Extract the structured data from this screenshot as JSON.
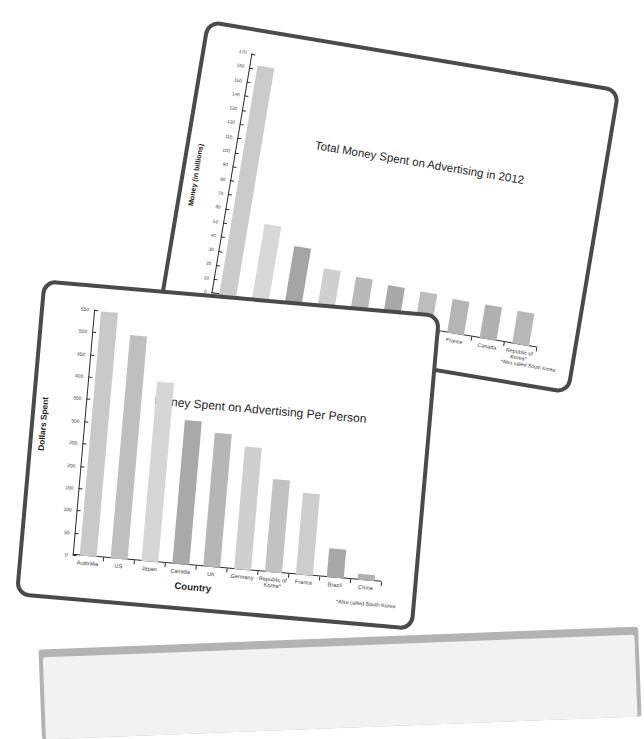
{
  "page": {
    "background_color": "#ffffff",
    "card_border_color": "#4a4a4a",
    "card_background_color": "#ffffff",
    "slab_color": "#b3b3b3"
  },
  "chart_data": [
    {
      "type": "bar",
      "title": "Total Money  Spent on Advertising in 2012",
      "xlabel": "Country",
      "ylabel": "Money (in billions)",
      "footnote": "*Also called South Korea",
      "categories": [
        "US",
        "Japan",
        "China",
        "Germany",
        "UK",
        "Brazil",
        "Australia",
        "France",
        "Canada",
        "Republic of Korea*"
      ],
      "values": [
        162,
        54,
        42,
        30,
        28,
        26,
        25,
        24,
        24,
        23
      ],
      "ylim": [
        0,
        170
      ],
      "yticks": [
        0,
        10,
        20,
        30,
        40,
        50,
        60,
        70,
        80,
        90,
        100,
        110,
        120,
        130,
        140,
        150,
        160,
        170
      ],
      "grid": false,
      "legend": "none",
      "bar_colors": [
        "#cbcbcb",
        "#d8d8d8",
        "#a5a5a5",
        "#cfcfcf",
        "#b9b9b9",
        "#a8a8a8",
        "#bdbdbd",
        "#b5b5b5",
        "#b0b0b0",
        "#b8b8b8"
      ]
    },
    {
      "type": "bar",
      "title": "Money Spent on Advertising Per Person",
      "xlabel": "Country",
      "ylabel": "Dollars Spent",
      "footnote": "*Also called South Korea",
      "categories": [
        "Australia",
        "US",
        "Japan",
        "Canada",
        "UK",
        "Germany",
        "Republic of Korea*",
        "France",
        "Brazil",
        "China"
      ],
      "values": [
        548,
        500,
        403,
        323,
        300,
        275,
        207,
        183,
        65,
        13
      ],
      "ylim": [
        0,
        550
      ],
      "yticks": [
        0,
        50,
        100,
        150,
        200,
        250,
        300,
        350,
        400,
        450,
        500,
        550
      ],
      "grid": false,
      "legend": "none",
      "bar_colors": [
        "#c9c9c9",
        "#bfbfbf",
        "#d6d6d6",
        "#a9a9a9",
        "#b6b6b6",
        "#cfcfcf",
        "#c2c2c2",
        "#cdcdcd",
        "#a7a7a7",
        "#b0b0b0"
      ]
    }
  ]
}
